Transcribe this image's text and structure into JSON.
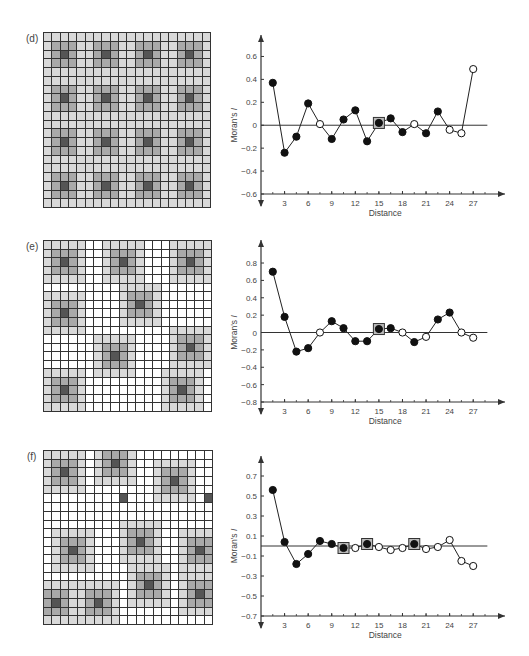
{
  "panels": [
    {
      "label": "(d)",
      "grid": {
        "rows": 20,
        "cols": 20,
        "background_level": 1,
        "hotspots": [
          [
            2,
            2
          ],
          [
            2,
            7
          ],
          [
            2,
            12
          ],
          [
            2,
            17
          ],
          [
            7,
            2
          ],
          [
            7,
            7
          ],
          [
            7,
            12
          ],
          [
            7,
            17
          ],
          [
            12,
            2
          ],
          [
            12,
            7
          ],
          [
            12,
            12
          ],
          [
            12,
            17
          ],
          [
            17,
            2
          ],
          [
            17,
            7
          ],
          [
            17,
            12
          ],
          [
            17,
            17
          ]
        ]
      }
    },
    {
      "label": "(e)",
      "grid": {
        "rows": 20,
        "cols": 20,
        "background_level": 0,
        "hotspots": [
          [
            2,
            2
          ],
          [
            2,
            9
          ],
          [
            2,
            17
          ],
          [
            8,
            2
          ],
          [
            7,
            11
          ],
          [
            13,
            8
          ],
          [
            12,
            17
          ],
          [
            17,
            2
          ],
          [
            17,
            16
          ]
        ]
      }
    },
    {
      "label": "(f)",
      "grid": {
        "rows": 20,
        "cols": 20,
        "background_level": 0,
        "hotspots": [
          [
            2,
            2
          ],
          [
            1,
            8
          ],
          [
            3,
            15
          ],
          [
            5,
            19
          ],
          [
            5,
            9
          ],
          [
            11,
            3
          ],
          [
            10,
            11
          ],
          [
            11,
            18
          ],
          [
            15,
            12
          ],
          [
            17,
            6
          ],
          [
            16,
            18
          ],
          [
            17,
            1
          ]
        ],
        "singles": [
          [
            5,
            9
          ],
          [
            5,
            19
          ]
        ]
      }
    }
  ],
  "chart_data": [
    {
      "type": "line",
      "panel": "(d)",
      "title": "",
      "xlabel": "Distance",
      "ylabel": "Moran's I",
      "xticks": [
        3,
        6,
        9,
        12,
        15,
        18,
        21,
        24,
        27
      ],
      "yticks": [
        -0.6,
        -0.4,
        -0.2,
        0,
        0.2,
        0.4,
        0.6
      ],
      "ylim": [
        -0.6,
        0.7
      ],
      "xlim": [
        0,
        30
      ],
      "grid": false,
      "points": [
        {
          "x": 1.5,
          "y": 0.37,
          "filled": true
        },
        {
          "x": 3,
          "y": -0.24,
          "filled": true
        },
        {
          "x": 4.5,
          "y": -0.1,
          "filled": true
        },
        {
          "x": 6,
          "y": 0.19,
          "filled": true
        },
        {
          "x": 7.5,
          "y": 0.01,
          "filled": false
        },
        {
          "x": 9,
          "y": -0.12,
          "filled": true
        },
        {
          "x": 10.5,
          "y": 0.05,
          "filled": true
        },
        {
          "x": 12,
          "y": 0.13,
          "filled": true
        },
        {
          "x": 13.5,
          "y": -0.14,
          "filled": true
        },
        {
          "x": 15,
          "y": 0.02,
          "filled": true,
          "boxed": true
        },
        {
          "x": 16.5,
          "y": 0.06,
          "filled": true
        },
        {
          "x": 18,
          "y": -0.06,
          "filled": true
        },
        {
          "x": 19.5,
          "y": 0.01,
          "filled": false
        },
        {
          "x": 21,
          "y": -0.07,
          "filled": true
        },
        {
          "x": 22.5,
          "y": 0.12,
          "filled": true
        },
        {
          "x": 24,
          "y": -0.04,
          "filled": false
        },
        {
          "x": 25.5,
          "y": -0.07,
          "filled": false
        },
        {
          "x": 27,
          "y": 0.49,
          "filled": false
        }
      ]
    },
    {
      "type": "line",
      "panel": "(e)",
      "title": "",
      "xlabel": "Distance",
      "ylabel": "Moran's I",
      "xticks": [
        3,
        6,
        9,
        12,
        15,
        18,
        21,
        24,
        27
      ],
      "yticks": [
        -0.8,
        -0.6,
        -0.4,
        -0.2,
        0,
        0.2,
        0.4,
        0.6,
        0.8
      ],
      "ylim": [
        -0.8,
        0.95
      ],
      "xlim": [
        0,
        30
      ],
      "grid": false,
      "points": [
        {
          "x": 1.5,
          "y": 0.7,
          "filled": true
        },
        {
          "x": 3,
          "y": 0.18,
          "filled": true
        },
        {
          "x": 4.5,
          "y": -0.22,
          "filled": true
        },
        {
          "x": 6,
          "y": -0.18,
          "filled": true
        },
        {
          "x": 7.5,
          "y": 0.0,
          "filled": false
        },
        {
          "x": 9,
          "y": 0.13,
          "filled": true
        },
        {
          "x": 10.5,
          "y": 0.05,
          "filled": true
        },
        {
          "x": 12,
          "y": -0.1,
          "filled": true
        },
        {
          "x": 13.5,
          "y": -0.1,
          "filled": true
        },
        {
          "x": 15,
          "y": 0.04,
          "filled": true,
          "boxed": true
        },
        {
          "x": 16.5,
          "y": 0.05,
          "filled": true
        },
        {
          "x": 18,
          "y": 0.0,
          "filled": false
        },
        {
          "x": 19.5,
          "y": -0.11,
          "filled": true
        },
        {
          "x": 21,
          "y": -0.05,
          "filled": false
        },
        {
          "x": 22.5,
          "y": 0.15,
          "filled": true
        },
        {
          "x": 24,
          "y": 0.23,
          "filled": true
        },
        {
          "x": 25.5,
          "y": 0.0,
          "filled": false
        },
        {
          "x": 27,
          "y": -0.06,
          "filled": false
        }
      ]
    },
    {
      "type": "line",
      "panel": "(f)",
      "title": "",
      "xlabel": "Distance",
      "ylabel": "Moran's I",
      "xticks": [
        3,
        6,
        9,
        12,
        15,
        18,
        21,
        24,
        27
      ],
      "yticks": [
        -0.7,
        -0.5,
        -0.3,
        -0.1,
        0.1,
        0.3,
        0.5,
        0.7
      ],
      "ylim": [
        -0.7,
        0.8
      ],
      "xlim": [
        0,
        30
      ],
      "grid": false,
      "points": [
        {
          "x": 1.5,
          "y": 0.56,
          "filled": true
        },
        {
          "x": 3,
          "y": 0.04,
          "filled": true
        },
        {
          "x": 4.5,
          "y": -0.18,
          "filled": true
        },
        {
          "x": 6,
          "y": -0.08,
          "filled": true
        },
        {
          "x": 7.5,
          "y": 0.05,
          "filled": true
        },
        {
          "x": 9,
          "y": 0.02,
          "filled": true
        },
        {
          "x": 10.5,
          "y": -0.02,
          "filled": true,
          "boxed": true
        },
        {
          "x": 12,
          "y": -0.02,
          "filled": false
        },
        {
          "x": 13.5,
          "y": 0.02,
          "filled": true,
          "boxed": true
        },
        {
          "x": 15,
          "y": -0.01,
          "filled": false
        },
        {
          "x": 16.5,
          "y": -0.04,
          "filled": false
        },
        {
          "x": 18,
          "y": -0.02,
          "filled": false
        },
        {
          "x": 19.5,
          "y": 0.02,
          "filled": true,
          "boxed": true
        },
        {
          "x": 21,
          "y": -0.03,
          "filled": false
        },
        {
          "x": 22.5,
          "y": -0.01,
          "filled": false
        },
        {
          "x": 24,
          "y": 0.06,
          "filled": false
        },
        {
          "x": 25.5,
          "y": -0.15,
          "filled": false
        },
        {
          "x": 27,
          "y": -0.2,
          "filled": false
        }
      ]
    }
  ]
}
